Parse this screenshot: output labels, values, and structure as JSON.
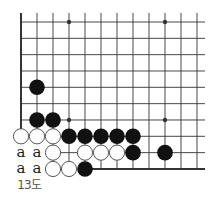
{
  "diagram": {
    "type": "go-board-corner",
    "caption": "13도",
    "grid": {
      "cols": 12,
      "rows": 10,
      "x0": 21,
      "y0": 22,
      "dx": 16,
      "dy": 16.33
    },
    "edges": {
      "left": true,
      "bottom": true,
      "top": false,
      "right": false
    },
    "star_points": [
      [
        3,
        0
      ],
      [
        9,
        0
      ],
      [
        3,
        6
      ],
      [
        9,
        6
      ]
    ],
    "stones": {
      "black": [
        [
          1,
          4
        ],
        [
          1,
          6
        ],
        [
          2,
          6
        ],
        [
          3,
          7
        ],
        [
          4,
          7
        ],
        [
          5,
          7
        ],
        [
          6,
          7
        ],
        [
          7,
          7
        ],
        [
          7,
          8
        ],
        [
          9,
          8
        ],
        [
          4,
          9
        ]
      ],
      "white": [
        [
          0,
          7
        ],
        [
          1,
          7
        ],
        [
          2,
          7
        ],
        [
          2,
          8
        ],
        [
          4,
          8
        ],
        [
          5,
          8
        ],
        [
          6,
          8
        ],
        [
          2,
          9
        ],
        [
          3,
          9
        ]
      ]
    },
    "labels": [
      {
        "col": 0,
        "row": 8,
        "text": "a"
      },
      {
        "col": 1,
        "row": 8,
        "text": "a"
      },
      {
        "col": 0,
        "row": 9,
        "text": "a"
      },
      {
        "col": 1,
        "row": 9,
        "text": "a"
      }
    ],
    "colors": {
      "line": "#333333",
      "black_stone": "#111111",
      "white_stone": "#ffffff",
      "stone_outline": "#444444"
    }
  }
}
